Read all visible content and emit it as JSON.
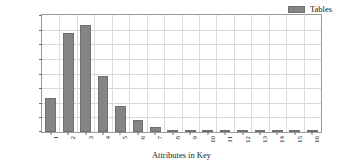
{
  "chart_data": {
    "type": "bar",
    "title": "",
    "xlabel": "Attributes in Key",
    "ylabel": "Nr. of Tables",
    "categories": [
      "1",
      "2",
      "3",
      "4",
      "5",
      "6",
      "7",
      "8",
      "9",
      "10",
      "11",
      "12",
      "13",
      "14",
      "15",
      "16"
    ],
    "values": [
      2320,
      6780,
      7340,
      3820,
      1780,
      830,
      330,
      160,
      70,
      25,
      10,
      6,
      3,
      2,
      1,
      1
    ],
    "series": [
      {
        "name": "Tables",
        "values": [
          2320,
          6780,
          7340,
          3820,
          1780,
          830,
          330,
          160,
          70,
          25,
          10,
          6,
          3,
          2,
          1,
          1
        ]
      }
    ],
    "ylim": [
      0,
      8000
    ],
    "yticks": [
      0,
      1000,
      2000,
      3000,
      4000,
      5000,
      6000,
      7000,
      8000
    ],
    "ytick_labels": [
      "0",
      "1000",
      "2000",
      "3000",
      "4000",
      "5000",
      "6000",
      "7000",
      "8000"
    ],
    "grid": true,
    "legend": {
      "position": "top-right",
      "entries": [
        {
          "label": "Tables",
          "color": "#858585"
        }
      ]
    },
    "bar_color": "#858585",
    "bar_edge_color": "#6f6f6f",
    "grid_color": "#d8d8d8",
    "axis_color": "#9a9a9a",
    "xtick_rotation": -90
  }
}
